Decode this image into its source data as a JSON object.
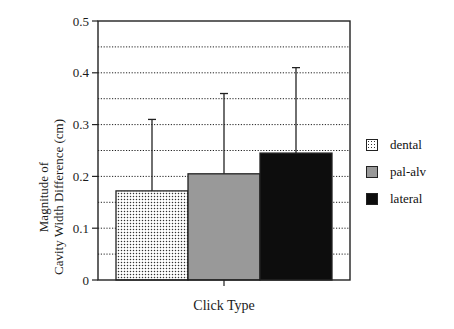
{
  "chart_data": {
    "type": "bar",
    "title": "",
    "xlabel": "Click Type",
    "ylabel_lines": [
      "Magnitude of",
      "Cavity Width Difference (cm)"
    ],
    "ylabel": "Magnitude of Cavity Width Difference (cm)",
    "ylim": [
      0,
      0.5
    ],
    "yticks": [
      "0",
      "0.1",
      "0.2",
      "0.3",
      "0.4",
      "0.5"
    ],
    "grid": "dotted horizontal at 0.05 intervals",
    "legend_position": "right",
    "categories": [
      "Click Type"
    ],
    "series": [
      {
        "name": "dental",
        "values": [
          0.172
        ],
        "error_upper": [
          0.31
        ],
        "fill": "dotted",
        "color": "#ffffff"
      },
      {
        "name": "pal-alv",
        "values": [
          0.205
        ],
        "error_upper": [
          0.36
        ],
        "fill": "solid",
        "color": "#999999"
      },
      {
        "name": "lateral",
        "values": [
          0.245
        ],
        "error_upper": [
          0.41
        ],
        "fill": "solid",
        "color": "#0d0d0d"
      }
    ]
  },
  "legend": {
    "items": [
      {
        "label": "dental"
      },
      {
        "label": "pal-alv"
      },
      {
        "label": "lateral"
      }
    ]
  }
}
